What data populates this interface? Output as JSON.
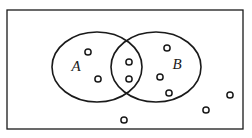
{
  "figure": {
    "type": "venn-diagram",
    "width": 252,
    "height": 138,
    "background_color": "#ffffff",
    "stroke_color": "#1a1a1a"
  },
  "universe": {
    "shape": "rectangle",
    "x": 7,
    "y": 10,
    "width": 236,
    "height": 119,
    "stroke_width": 1.3,
    "fill": "#ffffff"
  },
  "sets": [
    {
      "id": "A",
      "label": "A",
      "label_x": 76,
      "label_y": 68,
      "cx": 97,
      "cy": 67,
      "rx": 45,
      "ry": 35,
      "stroke_width": 1.6
    },
    {
      "id": "B",
      "label": "B",
      "label_x": 177,
      "label_y": 66,
      "cx": 156,
      "cy": 67,
      "rx": 45,
      "ry": 35,
      "stroke_width": 1.6
    }
  ],
  "elements": {
    "radius": 3.1,
    "stroke_width": 1.5,
    "fill": "#ffffff",
    "counts": {
      "a_only": 2,
      "intersection": 2,
      "b_only": 3,
      "outside": 3,
      "total": 10
    },
    "points": [
      {
        "id": "a1",
        "region": "a_only",
        "cx": 88,
        "cy": 52
      },
      {
        "id": "a2",
        "region": "a_only",
        "cx": 98,
        "cy": 79
      },
      {
        "id": "i1",
        "region": "intersection",
        "cx": 129,
        "cy": 62
      },
      {
        "id": "i2",
        "region": "intersection",
        "cx": 129,
        "cy": 79
      },
      {
        "id": "b1",
        "region": "b_only",
        "cx": 167,
        "cy": 48
      },
      {
        "id": "b2",
        "region": "b_only",
        "cx": 160,
        "cy": 77
      },
      {
        "id": "b3",
        "region": "b_only",
        "cx": 169,
        "cy": 93
      },
      {
        "id": "o1",
        "region": "outside",
        "cx": 124,
        "cy": 120
      },
      {
        "id": "o2",
        "region": "outside",
        "cx": 206,
        "cy": 110
      },
      {
        "id": "o3",
        "region": "outside",
        "cx": 230,
        "cy": 95
      }
    ]
  }
}
